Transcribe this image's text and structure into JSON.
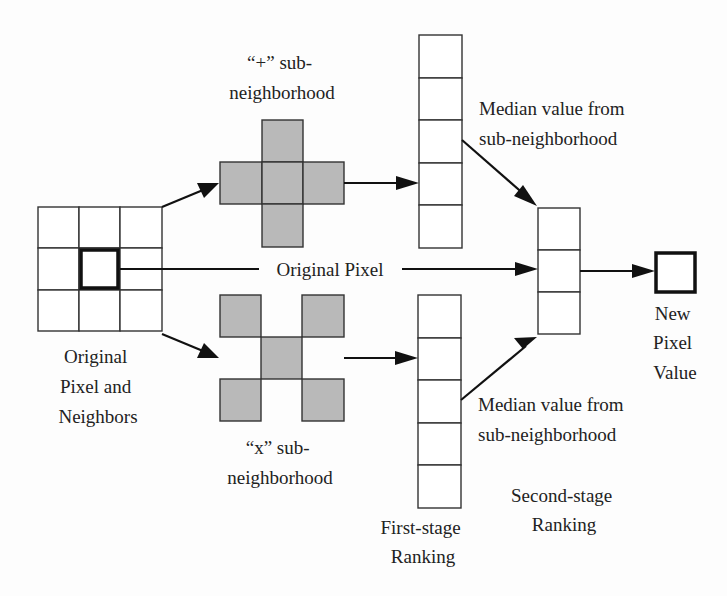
{
  "diagram": {
    "type": "median-filter-two-stage-ranking",
    "labels": {
      "plus_sub": {
        "line1": "“+” sub-",
        "line2": "neighborhood"
      },
      "x_sub": {
        "line1": "“x” sub-",
        "line2": "neighborhood"
      },
      "original_neighbors": {
        "line1": "Original",
        "line2": "Pixel and",
        "line3": "Neighbors"
      },
      "original_pixel": "Original Pixel",
      "median_top": {
        "line1": "Median value from",
        "line2": "sub-neighborhood"
      },
      "median_bottom": {
        "line1": "Median value from",
        "line2": "sub-neighborhood"
      },
      "new_pixel": {
        "line1": "New",
        "line2": "Pixel",
        "line3": "Value"
      },
      "first_stage": {
        "line1": "First-stage",
        "line2": "Ranking"
      },
      "second_stage": {
        "line1": "Second-stage",
        "line2": "Ranking"
      }
    },
    "nodes": [
      {
        "id": "neighborhood-3x3",
        "label": "Original Pixel and Neighbors",
        "cells": 9
      },
      {
        "id": "plus-sub-neighborhood",
        "label": "“+” sub-neighborhood",
        "cells": 5
      },
      {
        "id": "x-sub-neighborhood",
        "label": "“x” sub-neighborhood",
        "cells": 5
      },
      {
        "id": "first-stage-top",
        "label": "First-stage Ranking",
        "cells": 5
      },
      {
        "id": "first-stage-bottom",
        "label": "First-stage Ranking",
        "cells": 5
      },
      {
        "id": "second-stage",
        "label": "Second-stage Ranking",
        "cells": 3
      },
      {
        "id": "new-pixel",
        "label": "New Pixel Value",
        "cells": 1
      }
    ],
    "edges": [
      {
        "from": "neighborhood-3x3",
        "to": "plus-sub-neighborhood"
      },
      {
        "from": "neighborhood-3x3",
        "to": "x-sub-neighborhood"
      },
      {
        "from": "plus-sub-neighborhood",
        "to": "first-stage-top"
      },
      {
        "from": "x-sub-neighborhood",
        "to": "first-stage-bottom"
      },
      {
        "from": "first-stage-top",
        "to": "second-stage",
        "label": "Median value from sub-neighborhood"
      },
      {
        "from": "first-stage-bottom",
        "to": "second-stage",
        "label": "Median value from sub-neighborhood"
      },
      {
        "from": "neighborhood-3x3",
        "to": "second-stage",
        "label": "Original Pixel"
      },
      {
        "from": "second-stage",
        "to": "new-pixel"
      }
    ],
    "colors": {
      "background": "#fdfdfd",
      "stroke": "#333333",
      "gray_fill": "#b9b9b9",
      "text": "#222222"
    }
  }
}
